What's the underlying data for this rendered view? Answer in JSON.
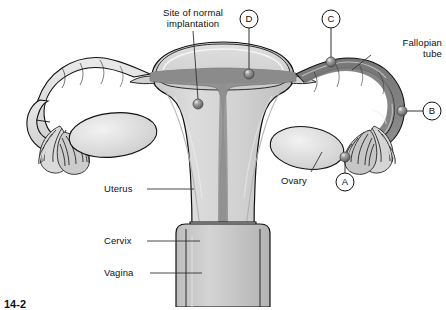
{
  "figure": {
    "caption": "14-2",
    "background_color": "#ffffff"
  },
  "colors": {
    "outline": "#111111",
    "tissue_light": "#e3e3e3",
    "tissue_mid": "#cfcfcf",
    "tissue_dark": "#9a9a9a",
    "cavity_dark": "#7d7d7d",
    "lumen_dark": "#6e6e6e",
    "sphere": "#8a8a8a",
    "leader_line": "#333333",
    "text": "#111111"
  },
  "labels": [
    {
      "id": "site-of-normal-implantation",
      "text": "Site of normal\nimplantation",
      "x": 141,
      "y": 7,
      "width": 104,
      "align": "center"
    },
    {
      "id": "fallopian-tube",
      "text": "Fallopian\ntube",
      "x": 372,
      "y": 37,
      "width": 70,
      "align": "left"
    },
    {
      "id": "ovary",
      "text": "Ovary",
      "x": 281,
      "y": 175,
      "width": 46,
      "align": "left"
    },
    {
      "id": "uterus",
      "text": "Uterus",
      "x": 104,
      "y": 183,
      "width": 46,
      "align": "left"
    },
    {
      "id": "cervix",
      "text": "Cervix",
      "x": 104,
      "y": 235,
      "width": 46,
      "align": "left"
    },
    {
      "id": "vagina",
      "text": "Vagina",
      "x": 104,
      "y": 267,
      "width": 46,
      "align": "left"
    }
  ],
  "markers": [
    {
      "id": "marker-a",
      "letter": "A",
      "circle_x": 345,
      "circle_y": 182,
      "radius": 9,
      "target_x": 345,
      "target_y": 157,
      "sphere_r": 5
    },
    {
      "id": "marker-b",
      "letter": "B",
      "circle_x": 432,
      "circle_y": 111,
      "radius": 9,
      "target_x": 402,
      "target_y": 111,
      "sphere_r": 5
    },
    {
      "id": "marker-c",
      "letter": "C",
      "circle_x": 331,
      "circle_y": 19,
      "radius": 9,
      "target_x": 331,
      "target_y": 62,
      "sphere_r": 5
    },
    {
      "id": "marker-d",
      "letter": "D",
      "circle_x": 249,
      "circle_y": 19,
      "radius": 9,
      "target_x": 249,
      "target_y": 74,
      "sphere_r": 5
    }
  ],
  "implantation_point": {
    "id": "normal-implantation-sphere",
    "x": 198,
    "y": 104,
    "sphere_r": 5
  },
  "leaders": [
    {
      "id": "leader-implantation",
      "x1": 193,
      "y1": 31,
      "x2": 198,
      "y2": 99
    },
    {
      "id": "leader-fallopian-tube",
      "x1": 371,
      "y1": 55,
      "x2": 352,
      "y2": 70
    },
    {
      "id": "leader-ovary",
      "x1": 311,
      "y1": 172,
      "x2": 322,
      "y2": 152
    },
    {
      "id": "leader-uterus",
      "x1": 147,
      "y1": 189,
      "x2": 194,
      "y2": 189
    },
    {
      "id": "leader-cervix",
      "x1": 147,
      "y1": 241,
      "x2": 200,
      "y2": 241
    },
    {
      "id": "leader-vagina",
      "x1": 150,
      "y1": 273,
      "x2": 202,
      "y2": 273
    }
  ],
  "structures": [
    {
      "id": "uterus-body",
      "name": "uterus"
    },
    {
      "id": "uterine-cavity",
      "name": "endometrial-cavity"
    },
    {
      "id": "cervix-body",
      "name": "cervix"
    },
    {
      "id": "vagina-body",
      "name": "vagina"
    },
    {
      "id": "fallopian-tube-left",
      "name": "left-fallopian-tube"
    },
    {
      "id": "fallopian-tube-right",
      "name": "right-fallopian-tube-cutaway"
    },
    {
      "id": "ovary-left",
      "name": "left-ovary"
    },
    {
      "id": "ovary-right",
      "name": "right-ovary"
    },
    {
      "id": "fimbriae-left",
      "name": "left-fimbriae"
    },
    {
      "id": "fimbriae-right",
      "name": "right-fimbriae"
    }
  ]
}
